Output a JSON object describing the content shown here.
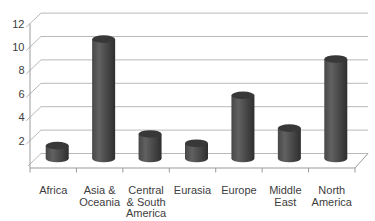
{
  "chart_data": {
    "type": "bar",
    "style": "3d-cylinder-column",
    "title": "",
    "xlabel": "",
    "ylabel": "",
    "categories": [
      "Africa",
      "Asia & Oceania",
      "Central & South America",
      "Eurasia",
      "Europe",
      "Middle East",
      "North America"
    ],
    "category_label_lines": [
      [
        "Africa"
      ],
      [
        "Asia &",
        "Oceania"
      ],
      [
        "Central",
        "& South",
        "America"
      ],
      [
        "Eurasia"
      ],
      [
        "Europe"
      ],
      [
        "Middle",
        "East"
      ],
      [
        "North",
        "America"
      ]
    ],
    "values": [
      1.1,
      10.2,
      2.1,
      1.3,
      5.4,
      2.6,
      8.5
    ],
    "ylim": [
      0,
      12
    ],
    "yticks": [
      2,
      4,
      6,
      8,
      10,
      12
    ],
    "grid": true,
    "legend": false
  },
  "colors": {
    "background": "#ffffff",
    "bar_body_edge": "#474747",
    "bar_body_mid": "#616161",
    "bar_body_dark": "#2e2e2e",
    "bar_top": "#383838",
    "gridline": "#b9b9b9",
    "axis_line": "#9a9a9a",
    "text": "#3d3d3d"
  }
}
